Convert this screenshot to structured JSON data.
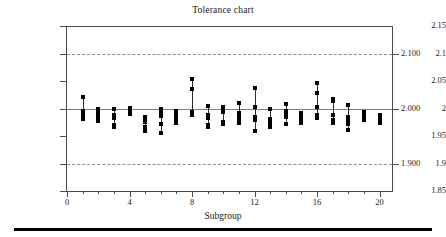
{
  "chart": {
    "title": "Tolerance chart",
    "xlabel": "Subgroup",
    "ylabel": "Diameter"
  },
  "axes": {
    "y_left_ticks": [
      "1.85",
      "1.9",
      "1.95",
      "2",
      "2.05",
      "2.1",
      "2.15"
    ],
    "y_right_ticks": [
      "1.900",
      "2.000",
      "2.100"
    ],
    "x_ticks": [
      "0",
      "4",
      "8",
      "12",
      "16",
      "20"
    ]
  },
  "chart_data": {
    "type": "scatter",
    "title": "Tolerance chart",
    "xlabel": "Subgroup",
    "ylabel": "Diameter",
    "xlim": [
      0,
      20.8
    ],
    "ylim": [
      1.85,
      2.15
    ],
    "grid": "dashed horizontal gridlines at 2.100 and 1.900",
    "legend": "none",
    "center_line": 2.0,
    "spec_limits": [
      1.9,
      2.1
    ],
    "y_left_ticks": [
      1.85,
      1.9,
      1.95,
      2.0,
      2.05,
      2.1,
      2.15
    ],
    "y_right_ticks": [
      1.9,
      2.0,
      2.1
    ],
    "x_ticks": [
      0,
      4,
      8,
      12,
      16,
      20
    ],
    "point_color": "#000000",
    "series": [
      {
        "name": "Subgroup 1",
        "x": 1,
        "values": [
          2.021,
          1.995,
          1.99,
          1.984,
          1.981
        ]
      },
      {
        "name": "Subgroup 2",
        "x": 2,
        "values": [
          2.0,
          1.996,
          1.99,
          1.984,
          1.978
        ]
      },
      {
        "name": "Subgroup 3",
        "x": 3,
        "values": [
          1.999,
          1.989,
          1.983,
          1.97,
          1.966
        ]
      },
      {
        "name": "Subgroup 4",
        "x": 4,
        "values": [
          2.001,
          1.998,
          1.995,
          1.992,
          1.99
        ]
      },
      {
        "name": "Subgroup 5",
        "x": 5,
        "values": [
          1.985,
          1.98,
          1.975,
          1.966,
          1.959
        ]
      },
      {
        "name": "Subgroup 6",
        "x": 6,
        "values": [
          2.0,
          1.994,
          1.986,
          1.971,
          1.955
        ]
      },
      {
        "name": "Subgroup 7",
        "x": 7,
        "values": [
          1.996,
          1.991,
          1.986,
          1.98,
          1.973
        ]
      },
      {
        "name": "Subgroup 8",
        "x": 8,
        "values": [
          2.054,
          2.035,
          1.994,
          1.991,
          1.988
        ]
      },
      {
        "name": "Subgroup 9",
        "x": 9,
        "values": [
          2.005,
          1.988,
          1.983,
          1.97,
          1.966
        ]
      },
      {
        "name": "Subgroup 10",
        "x": 10,
        "values": [
          2.002,
          1.998,
          1.994,
          1.975,
          1.971
        ]
      },
      {
        "name": "Subgroup 11",
        "x": 11,
        "values": [
          2.01,
          1.991,
          1.985,
          1.979,
          1.974
        ]
      },
      {
        "name": "Subgroup 12",
        "x": 12,
        "values": [
          2.038,
          2.003,
          1.985,
          1.98,
          1.96
        ]
      },
      {
        "name": "Subgroup 13",
        "x": 13,
        "values": [
          2.0,
          1.981,
          1.975,
          1.971,
          1.967
        ]
      },
      {
        "name": "Subgroup 14",
        "x": 14,
        "values": [
          2.008,
          1.996,
          1.991,
          1.984,
          1.971
        ]
      },
      {
        "name": "Subgroup 15",
        "x": 15,
        "values": [
          1.991,
          1.987,
          1.983,
          1.977,
          1.973
        ]
      },
      {
        "name": "Subgroup 16",
        "x": 16,
        "values": [
          2.046,
          2.028,
          2.003,
          1.989,
          1.982
        ]
      },
      {
        "name": "Subgroup 17",
        "x": 17,
        "values": [
          2.017,
          2.013,
          1.988,
          1.979,
          1.974
        ]
      },
      {
        "name": "Subgroup 18",
        "x": 18,
        "values": [
          2.007,
          1.985,
          1.98,
          1.971,
          1.961
        ]
      },
      {
        "name": "Subgroup 19",
        "x": 19,
        "values": [
          1.994,
          1.99,
          1.985,
          1.982,
          1.98
        ]
      },
      {
        "name": "Subgroup 20",
        "x": 20,
        "values": [
          1.988,
          1.984,
          1.98,
          1.976,
          1.973
        ]
      }
    ]
  }
}
